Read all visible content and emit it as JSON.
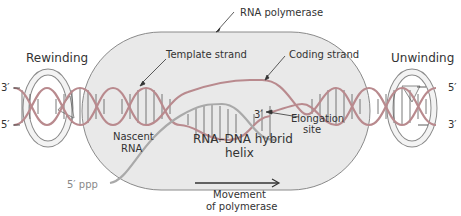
{
  "diagram": {
    "labels": {
      "rna_polymerase": "RNA polymerase",
      "rewinding": "Rewinding",
      "unwinding": "Unwinding",
      "template_strand": "Template strand",
      "coding_strand": "Coding strand",
      "left_3prime": "3′",
      "left_5prime": "5′",
      "right_5prime": "5′",
      "right_3prime": "3′",
      "rna_3prime": "3′",
      "elongation_line1": "Elongation",
      "elongation_line2": "site",
      "nascent_line1": "Nascent",
      "nascent_line2": "RNA",
      "hybrid_line1": "RNA–DNA hybrid",
      "hybrid_line2": "helix",
      "five_ppp": "5′ ppp",
      "movement_line1": "Movement",
      "movement_line2": "of polymerase"
    },
    "colors": {
      "polymerase_fill": "#e9e9e9",
      "polymerase_stroke": "#8a8a8a",
      "dna_strand": "#b98a8e",
      "rna_strand": "#a9a9a9",
      "rung": "#555555",
      "text": "#333333",
      "ppp_text": "#888888"
    }
  }
}
